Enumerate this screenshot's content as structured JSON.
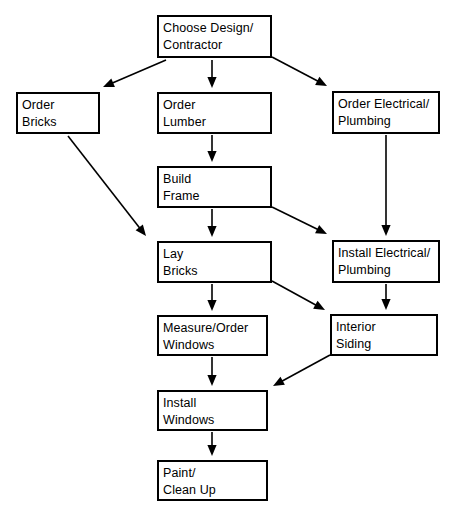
{
  "diagram": {
    "type": "flowchart",
    "background_color": "#ffffff",
    "line_color": "#000000",
    "nodes": [
      {
        "id": "choose-design",
        "line1": "Choose Design/",
        "line2": "Contractor",
        "x": 157,
        "y": 15,
        "w": 115,
        "h": 43
      },
      {
        "id": "order-bricks",
        "line1": "Order",
        "line2": "Bricks",
        "x": 16,
        "y": 92,
        "w": 84,
        "h": 42
      },
      {
        "id": "order-lumber",
        "line1": "Order",
        "line2": "Lumber",
        "x": 157,
        "y": 92,
        "w": 115,
        "h": 42
      },
      {
        "id": "order-electrical",
        "line1": "Order Electrical/",
        "line2": "Plumbing",
        "x": 332,
        "y": 91,
        "w": 108,
        "h": 43
      },
      {
        "id": "build-frame",
        "line1": "Build",
        "line2": "Frame",
        "x": 157,
        "y": 166,
        "w": 115,
        "h": 42
      },
      {
        "id": "lay-bricks",
        "line1": "Lay",
        "line2": "Bricks",
        "x": 157,
        "y": 241,
        "w": 115,
        "h": 42
      },
      {
        "id": "install-electrical",
        "line1": "Install Electrical/",
        "line2": "Plumbing",
        "x": 332,
        "y": 240,
        "w": 108,
        "h": 43
      },
      {
        "id": "measure-windows",
        "line1": "Measure/Order",
        "line2": "Windows",
        "x": 157,
        "y": 315,
        "w": 111,
        "h": 41
      },
      {
        "id": "interior-siding",
        "line1": "Interior",
        "line2": "Siding",
        "x": 330,
        "y": 314,
        "w": 108,
        "h": 42
      },
      {
        "id": "install-windows",
        "line1": "Install",
        "line2": "Windows",
        "x": 157,
        "y": 390,
        "w": 111,
        "h": 41
      },
      {
        "id": "paint-cleanup",
        "line1": "Paint/",
        "line2": "Clean Up",
        "x": 157,
        "y": 460,
        "w": 111,
        "h": 41
      }
    ],
    "edges": [
      {
        "id": "choose-to-bricks",
        "from": "choose-design",
        "to": "order-bricks",
        "x1": 166,
        "y1": 60,
        "x2": 103,
        "y2": 87
      },
      {
        "id": "choose-to-lumber",
        "from": "choose-design",
        "to": "order-lumber",
        "x1": 212,
        "y1": 60,
        "x2": 212,
        "y2": 88
      },
      {
        "id": "choose-to-electrical",
        "from": "choose-design",
        "to": "order-electrical",
        "x1": 272,
        "y1": 57,
        "x2": 327,
        "y2": 86
      },
      {
        "id": "bricks-to-lay-bricks",
        "from": "order-bricks",
        "to": "lay-bricks",
        "x1": 68,
        "y1": 136,
        "x2": 146,
        "y2": 236
      },
      {
        "id": "lumber-to-frame",
        "from": "order-lumber",
        "to": "build-frame",
        "x1": 212,
        "y1": 135,
        "x2": 212,
        "y2": 162
      },
      {
        "id": "frame-to-lay-bricks",
        "from": "build-frame",
        "to": "lay-bricks",
        "x1": 212,
        "y1": 209,
        "x2": 212,
        "y2": 237
      },
      {
        "id": "frame-to-install-electrical",
        "from": "build-frame",
        "to": "install-electrical",
        "x1": 272,
        "y1": 207,
        "x2": 327,
        "y2": 234
      },
      {
        "id": "electrical-to-install",
        "from": "order-electrical",
        "to": "install-electrical",
        "x1": 386,
        "y1": 135,
        "x2": 386,
        "y2": 236
      },
      {
        "id": "lay-bricks-to-measure",
        "from": "lay-bricks",
        "to": "measure-windows",
        "x1": 212,
        "y1": 284,
        "x2": 212,
        "y2": 311
      },
      {
        "id": "lay-bricks-to-siding",
        "from": "lay-bricks",
        "to": "interior-siding",
        "x1": 272,
        "y1": 281,
        "x2": 325,
        "y2": 310
      },
      {
        "id": "install-elec-to-siding",
        "from": "install-electrical",
        "to": "interior-siding",
        "x1": 386,
        "y1": 284,
        "x2": 386,
        "y2": 310
      },
      {
        "id": "measure-to-install-windows",
        "from": "measure-windows",
        "to": "install-windows",
        "x1": 212,
        "y1": 357,
        "x2": 212,
        "y2": 386
      },
      {
        "id": "siding-to-install-windows",
        "from": "interior-siding",
        "to": "install-windows",
        "x1": 330,
        "y1": 355,
        "x2": 273,
        "y2": 386
      },
      {
        "id": "windows-to-paint",
        "from": "install-windows",
        "to": "paint-cleanup",
        "x1": 212,
        "y1": 432,
        "x2": 212,
        "y2": 456
      }
    ]
  }
}
